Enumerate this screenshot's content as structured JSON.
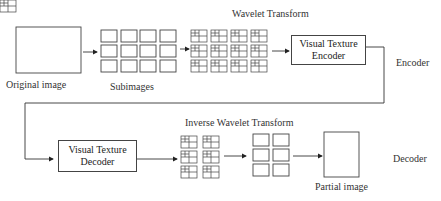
{
  "diagram": {
    "title_top": "Wavelet Transform",
    "title_bottom": "Inverse Wavelet Transform",
    "labels": {
      "original": "Original image",
      "subimages": "Subimages",
      "encoder_side": "Encoder",
      "decoder_side": "Decoder",
      "partial": "Partial image"
    },
    "encoder_box": {
      "line1": "Visual Texture",
      "line2": "Encoder"
    },
    "decoder_box": {
      "line1": "Visual Texture",
      "line2": "Decoder"
    }
  }
}
